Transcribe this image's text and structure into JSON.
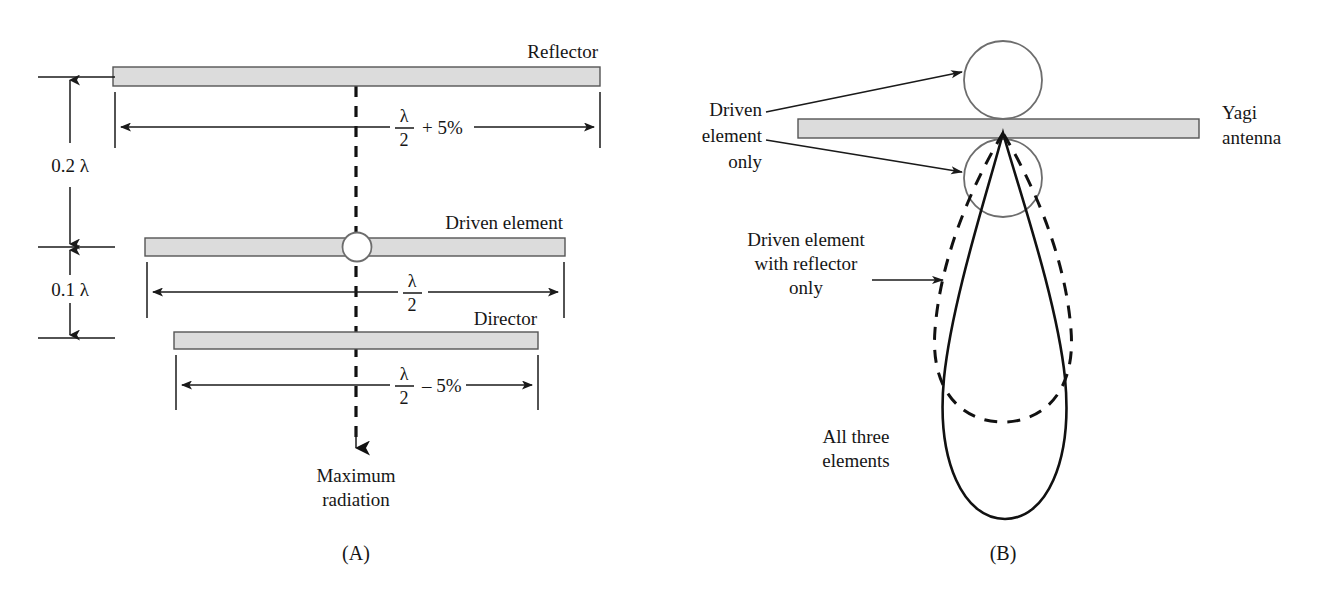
{
  "figure": {
    "panels": [
      {
        "id": "A",
        "caption": "(A)"
      },
      {
        "id": "B",
        "caption": "(B)"
      }
    ]
  },
  "panel_a": {
    "caption": "(A)",
    "elements": [
      {
        "name": "reflector",
        "label": "Reflector"
      },
      {
        "name": "driven-element",
        "label": "Driven element"
      },
      {
        "name": "director",
        "label": "Director"
      }
    ],
    "vertical_dimensions": [
      {
        "label": "0.2 λ",
        "between": "reflector-to-driven-element"
      },
      {
        "label": "0.1 λ",
        "between": "driven-element-to-director"
      }
    ],
    "horizontal_dimensions": [
      {
        "name": "reflector-length",
        "numerator": "λ",
        "denominator": "2",
        "suffix": "+ 5%"
      },
      {
        "name": "driven-element-length",
        "numerator": "λ",
        "denominator": "2",
        "suffix": ""
      },
      {
        "name": "director-length",
        "numerator": "λ",
        "denominator": "2",
        "suffix": "– 5%"
      }
    ],
    "radiation_label_line1": "Maximum",
    "radiation_label_line2": "radiation"
  },
  "panel_b": {
    "caption": "(B)",
    "antenna_label_line1": "Yagi",
    "antenna_label_line2": "antenna",
    "annotations": [
      {
        "name": "driven-element-only",
        "lines": [
          "Driven",
          "element",
          "only"
        ],
        "pattern": "two lobes, front and back"
      },
      {
        "name": "driven-element-with-reflector-only",
        "lines": [
          "Driven element",
          "with reflector",
          "only"
        ],
        "pattern": "broad forward lobe, dashed"
      },
      {
        "name": "all-three-elements",
        "lines": [
          "All three",
          "elements"
        ],
        "pattern": "narrow long forward lobe, solid"
      }
    ]
  },
  "colors": {
    "bar_fill": "#dcdcdc",
    "bar_stroke": "#555555",
    "line": "#1a1a1a",
    "circle_stroke": "#6d6d6d",
    "background": "#ffffff"
  }
}
